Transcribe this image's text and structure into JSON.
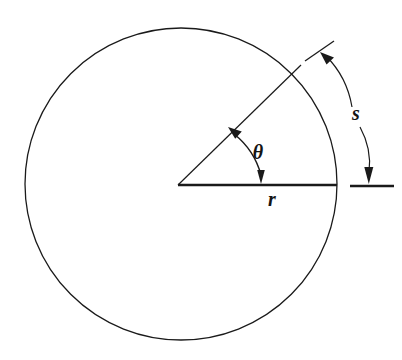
{
  "figure": {
    "kind": "geometry-diagram",
    "background_color": "#ffffff",
    "ink_color": "#1a1a1a",
    "canvas": {
      "width": 402,
      "height": 360
    }
  },
  "labels": {
    "angle": "θ",
    "radius": "r",
    "arc": "s"
  },
  "label_positions": {
    "angle": {
      "x": 258,
      "y": 159,
      "font_size": 20
    },
    "radius": {
      "x": 272,
      "y": 205,
      "font_size": 20
    },
    "arc": {
      "x": 355,
      "y": 119,
      "font_size": 20
    }
  },
  "geometry": {
    "circle": {
      "center_x": 181,
      "center_y": 184,
      "radius": 156,
      "stroke_width": 1.3
    },
    "radius_horizontal": {
      "x1": 178,
      "y1": 185,
      "x2": 337,
      "y2": 185,
      "stroke_width": 2.2
    },
    "radius_angled": {
      "x1": 178,
      "y1": 185,
      "x2": 300,
      "y2": 66,
      "stroke_width": 1.2,
      "angle_degrees": 44
    },
    "theta_arc": {
      "start_x": 262,
      "start_y": 183,
      "end_x": 240,
      "end_y": 130,
      "radius": 74,
      "stroke_width": 1.5,
      "double_headed": true
    },
    "arc_s_upper_tick": {
      "x1": 306,
      "y1": 60,
      "x2": 333,
      "y2": 42,
      "stroke_width": 1.3
    },
    "arc_s_upper_leader": {
      "start_x": 324,
      "start_y": 57,
      "ctrl_x": 346,
      "ctrl_y": 76,
      "end_x": 352,
      "end_y": 105,
      "stroke_width": 1.2,
      "arrowhead_at": "start"
    },
    "arc_s_lower_leader": {
      "start_x": 360,
      "start_y": 126,
      "ctrl_x": 371,
      "ctrl_y": 148,
      "end_x": 369,
      "end_y": 175,
      "stroke_width": 1.2,
      "arrowhead_at": "end"
    },
    "arc_s_lower_tick": {
      "x1": 350,
      "y1": 186,
      "x2": 394,
      "y2": 186,
      "stroke_width": 2.2
    }
  }
}
